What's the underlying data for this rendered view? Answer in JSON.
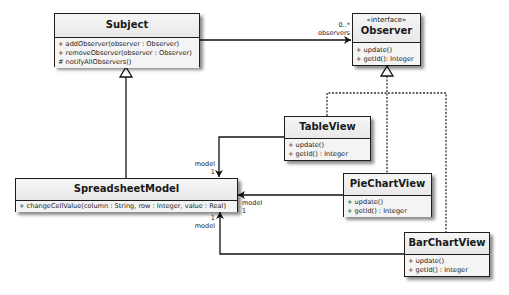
{
  "diagram": {
    "type": "uml-class-diagram",
    "classes": {
      "subject": {
        "name": "Subject",
        "methods": [
          "+ addObserver(observer : Observer)",
          "+ removeObserver(observer : Observer)",
          "# notifyAllObservers()"
        ]
      },
      "observer": {
        "stereotype": "«interface»",
        "name": "Observer",
        "methods": [
          "+ update()",
          "+ getId(): Integer"
        ]
      },
      "table_view": {
        "name": "TableView",
        "methods": [
          "+ update()",
          "+ getId() : Integer"
        ]
      },
      "spreadsheet_model": {
        "name": "SpreadsheetModel",
        "methods": [
          "+ changeCellValue(column : String, row : Integer, value : Real)"
        ]
      },
      "pie_chart_view": {
        "name": "PieChartView",
        "methods": [
          "+ update()",
          "+ getId() : Integer"
        ]
      },
      "bar_chart_view": {
        "name": "BarChartView",
        "methods": [
          "+ update()",
          "+ getId() : Integer"
        ]
      }
    },
    "relations": {
      "subject_observer": {
        "multiplicity": "0..*",
        "role": "observers"
      },
      "tableview_model": {
        "multiplicity": "1",
        "role": "model"
      },
      "piechart_model": {
        "multiplicity": "1",
        "role": "model"
      },
      "barchart_model": {
        "multiplicity": "1",
        "role": "model"
      }
    }
  }
}
